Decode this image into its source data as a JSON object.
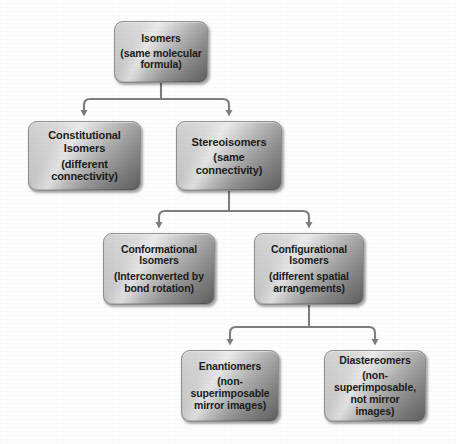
{
  "diagram": {
    "type": "hierarchy-tree",
    "colors": {
      "background": "#fdfdfd",
      "box_fill_light": "#d2d2d2",
      "box_fill_dark": "#8f8f8f",
      "box_border": "#8e8e8e",
      "connector": "#808080",
      "text": "#1b1b1b"
    },
    "nodes": [
      {
        "id": "isomers",
        "title": "Isomers",
        "subtitle": "(same molecular formula)"
      },
      {
        "id": "constitutional",
        "title": "Constitutional Isomers",
        "subtitle": "(different connectivity)"
      },
      {
        "id": "stereoisomers",
        "title": "Stereoisomers",
        "subtitle": "(same connectivity)"
      },
      {
        "id": "conformational",
        "title": "Conformational Isomers",
        "subtitle": "(Interconverted by bond rotation)"
      },
      {
        "id": "configurational",
        "title": "Configurational Isomers",
        "subtitle": "(different spatial arrangements)"
      },
      {
        "id": "enantiomers",
        "title": "Enantiomers",
        "subtitle": "(non-superimposable mirror images)"
      },
      {
        "id": "diastereomers",
        "title": "Diastereomers",
        "subtitle": "(non-superimposable, not mirror images)"
      }
    ],
    "edges": [
      {
        "from": "isomers",
        "to": "constitutional"
      },
      {
        "from": "isomers",
        "to": "stereoisomers"
      },
      {
        "from": "stereoisomers",
        "to": "conformational"
      },
      {
        "from": "stereoisomers",
        "to": "configurational"
      },
      {
        "from": "configurational",
        "to": "enantiomers"
      },
      {
        "from": "configurational",
        "to": "diastereomers"
      }
    ]
  }
}
